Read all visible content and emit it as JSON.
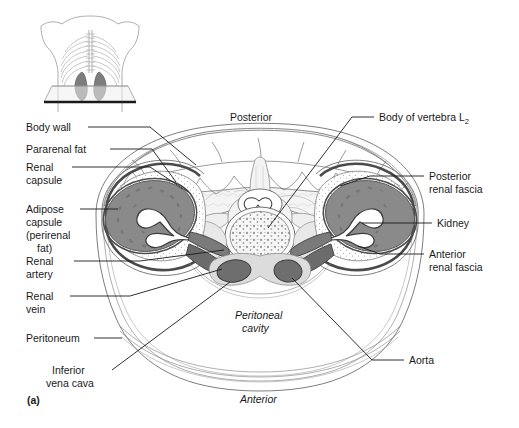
{
  "figure": {
    "panel_label": "(a)",
    "orientation": {
      "posterior": "Posterior",
      "anterior": "Anterior"
    },
    "interior_labels": [
      {
        "id": "peritoneal-cavity",
        "line1": "Peritoneal",
        "line2": "cavity"
      }
    ],
    "labels_left": [
      {
        "id": "body-wall",
        "line1": "Body wall",
        "line2": "",
        "line3": "",
        "line4": ""
      },
      {
        "id": "pararenal-fat",
        "line1": "Pararenal fat",
        "line2": "",
        "line3": "",
        "line4": ""
      },
      {
        "id": "renal-capsule",
        "line1": "Renal",
        "line2": "capsule",
        "line3": "",
        "line4": ""
      },
      {
        "id": "adipose-capsule",
        "line1": "Adipose",
        "line2": "capsule",
        "line3": "(perirenal",
        "line4": "fat)"
      },
      {
        "id": "renal-artery",
        "line1": "Renal",
        "line2": "artery",
        "line3": "",
        "line4": ""
      },
      {
        "id": "renal-vein",
        "line1": "Renal",
        "line2": "vein",
        "line3": "",
        "line4": ""
      },
      {
        "id": "peritoneum",
        "line1": "Peritoneum",
        "line2": "",
        "line3": "",
        "line4": ""
      },
      {
        "id": "inferior-vena-cava",
        "line1": "Inferior",
        "line2": "vena cava",
        "line3": "",
        "line4": ""
      }
    ],
    "labels_right": [
      {
        "id": "body-of-vertebra",
        "line1": "Body of vertebra L",
        "subscript": "2",
        "line2": ""
      },
      {
        "id": "posterior-renal-fascia",
        "line1": "Posterior",
        "subscript": "",
        "line2": "renal fascia"
      },
      {
        "id": "kidney",
        "line1": "Kidney",
        "subscript": "",
        "line2": ""
      },
      {
        "id": "anterior-renal-fascia",
        "line1": "Anterior",
        "subscript": "",
        "line2": "renal fascia"
      },
      {
        "id": "aorta",
        "line1": "Aorta",
        "subscript": "",
        "line2": ""
      }
    ],
    "colors": {
      "kidney_parenchyma": "#8a8a8a",
      "vessel_dark": "#5f5f5f",
      "fascia_line": "#6e6e6e",
      "background": "#ffffff",
      "text": "#1a1a1a",
      "inset_kidney": "#7d7d7d",
      "vertebral_body": "#f2f2f2",
      "muscle_light": "#ededed"
    }
  }
}
